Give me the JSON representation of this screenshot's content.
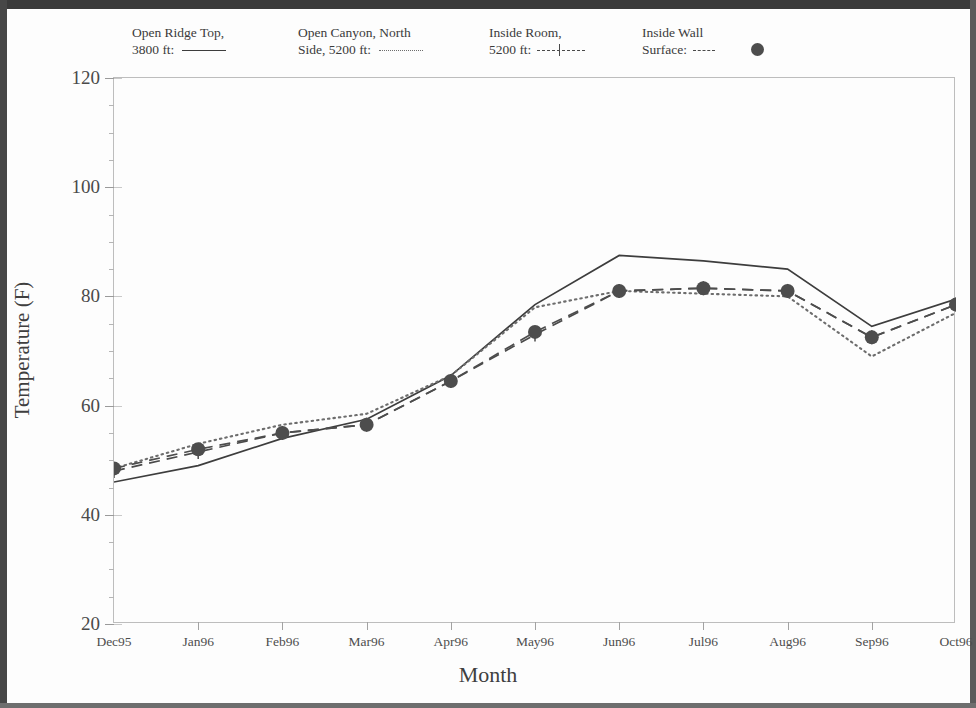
{
  "chart_data": {
    "type": "line",
    "title": "",
    "xlabel": "Month",
    "ylabel": "Temperature (F)",
    "categories": [
      "Dec95",
      "Jan96",
      "Feb96",
      "Mar96",
      "Apr96",
      "May96",
      "Jun96",
      "Jul96",
      "Aug96",
      "Sep96",
      "Oct96"
    ],
    "ylim": [
      20,
      120
    ],
    "y_ticks": [
      20,
      40,
      60,
      80,
      100,
      120
    ],
    "y_minor_step": 5,
    "grid": false,
    "legend_position": "above-plot",
    "series": [
      {
        "name": "Open Ridge Top, 3800 ft",
        "style": "solid",
        "marker": "none",
        "color": "#3d3d3d",
        "values": [
          46.0,
          49.0,
          54.0,
          57.5,
          65.5,
          78.5,
          87.5,
          86.5,
          85.0,
          74.5,
          79.5
        ]
      },
      {
        "name": "Open Canyon, North Side, 5200 ft",
        "style": "dotted",
        "marker": "none",
        "color": "#6d6d6d",
        "values": [
          48.5,
          53.0,
          56.5,
          58.5,
          65.5,
          78.0,
          81.0,
          80.5,
          80.0,
          69.0,
          77.0
        ]
      },
      {
        "name": "Inside Room, 5200 ft",
        "style": "dash-tick",
        "marker": "tick",
        "color": "#4a4a4a",
        "values": [
          48.0,
          51.5,
          55.0,
          56.5,
          64.5,
          73.0,
          81.0,
          81.5,
          81.0,
          72.5,
          78.5
        ]
      },
      {
        "name": "Inside Wall Surface",
        "style": "dashed",
        "marker": "circle",
        "color": "#4d4d4d",
        "values": [
          48.5,
          52.0,
          55.0,
          56.5,
          64.5,
          73.5,
          81.0,
          81.5,
          81.0,
          72.5,
          78.5
        ]
      }
    ]
  },
  "legend": {
    "entries": [
      {
        "line1": "Open Ridge Top,",
        "line2": "3800 ft:",
        "sample": "solid-line-sample"
      },
      {
        "line1": "Open Canyon, North",
        "line2": "Side, 5200 ft:",
        "sample": "dotted-line-sample"
      },
      {
        "line1": "Inside Room,",
        "line2": "5200 ft:",
        "sample": "dashed-tick-line-sample"
      },
      {
        "line1": "Inside Wall",
        "line2": "Surface:",
        "sample": "dashed-circle-sample"
      }
    ]
  },
  "axes": {
    "y_title": "Temperature (F)",
    "x_title": "Month",
    "y_tick_labels": [
      "120",
      "100",
      "80",
      "60",
      "40",
      "20"
    ],
    "x_tick_labels": [
      "Dec95",
      "Jan96",
      "Feb96",
      "Mar96",
      "Apr96",
      "May96",
      "Jun96",
      "Jul96",
      "Aug96",
      "Sep96",
      "Oct96"
    ]
  }
}
